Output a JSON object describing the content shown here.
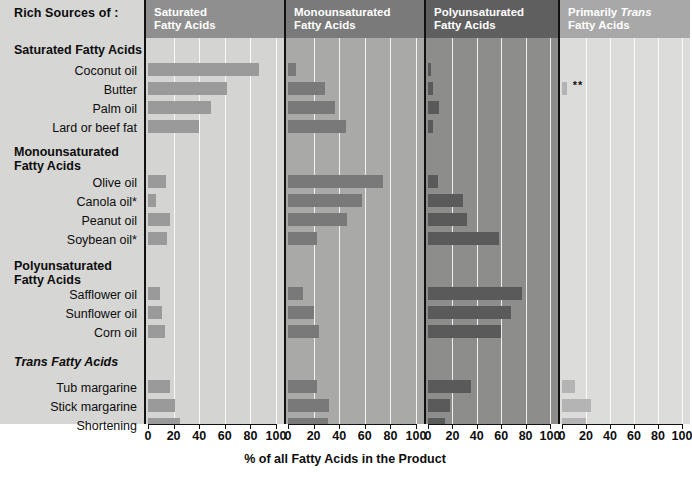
{
  "sidebar": {
    "title": "Rich Sources of :",
    "groups": [
      {
        "label": "Saturated Fatty Acids",
        "italic": false
      },
      {
        "label": "Monounsaturated\nFatty Acids",
        "italic": false
      },
      {
        "label": "Polyunsaturated\nFatty Acids",
        "italic": false
      },
      {
        "label": "Trans Fatty Acids",
        "italic": true
      }
    ],
    "row_labels": [
      "Coconut oil",
      "Butter",
      "Palm oil",
      "Lard or beef fat",
      "Olive oil",
      "Canola oil*",
      "Peanut oil",
      "Soybean oil*",
      "Safflower oil",
      "Sunflower oil",
      "Corn oil",
      "Tub margarine",
      "Stick margarine",
      "Shortening"
    ]
  },
  "panels": [
    {
      "title": "Saturated\nFatty Acids",
      "header_color": "#8f8f8f",
      "plot_color": "#d4d4d2",
      "bar_color": "#9a9a9a"
    },
    {
      "title": "Monounsaturated\nFatty Acids",
      "header_color": "#7a7a7a",
      "plot_color": "#a9a9a7",
      "bar_color": "#797979"
    },
    {
      "title": "Polyunsaturated\nFatty Acids",
      "header_color": "#5f5f5f",
      "plot_color": "#8d8d8b",
      "bar_color": "#5a5a5a"
    },
    {
      "title": "Primarily Trans\nFatty Acids",
      "header_color": "#a8a8a8",
      "plot_color": "#dcdcda",
      "bar_color": "#b4b4b4"
    }
  ],
  "annotations": {
    "butter_trans": "**"
  },
  "chart_data": {
    "type": "bar",
    "title": "Rich Sources of :",
    "xlabel": "% of all Fatty Acids in the Product",
    "ylabel": "",
    "xlim": [
      0,
      100
    ],
    "xticks": [
      0,
      20,
      40,
      60,
      80,
      100
    ],
    "grid": true,
    "legend_position": "panel-headers",
    "orientation": "horizontal",
    "categories": [
      "Coconut oil",
      "Butter",
      "Palm oil",
      "Lard or beef fat",
      "Olive oil",
      "Canola oil*",
      "Peanut oil",
      "Soybean oil*",
      "Safflower oil",
      "Sunflower oil",
      "Corn oil",
      "Tub margarine",
      "Stick margarine",
      "Shortening"
    ],
    "category_groups": [
      {
        "name": "Saturated Fatty Acids",
        "members": [
          "Coconut oil",
          "Butter",
          "Palm oil",
          "Lard or beef fat"
        ]
      },
      {
        "name": "Monounsaturated Fatty Acids",
        "members": [
          "Olive oil",
          "Canola oil*",
          "Peanut oil",
          "Soybean oil*"
        ]
      },
      {
        "name": "Polyunsaturated Fatty Acids",
        "members": [
          "Safflower oil",
          "Sunflower oil",
          "Corn oil"
        ]
      },
      {
        "name": "Trans Fatty Acids",
        "members": [
          "Tub margarine",
          "Stick margarine",
          "Shortening"
        ]
      }
    ],
    "series": [
      {
        "name": "Saturated Fatty Acids",
        "values": [
          87,
          62,
          49,
          40,
          14,
          6,
          17,
          15,
          9,
          11,
          13,
          17,
          21,
          25
        ]
      },
      {
        "name": "Monounsaturated Fatty Acids",
        "values": [
          6,
          29,
          37,
          45,
          74,
          58,
          46,
          23,
          12,
          20,
          24,
          23,
          32,
          31
        ]
      },
      {
        "name": "Polyunsaturated Fatty Acids",
        "values": [
          2,
          4,
          9,
          4,
          8,
          29,
          32,
          58,
          77,
          68,
          60,
          35,
          18,
          14
        ]
      },
      {
        "name": "Primarily Trans Fatty Acids",
        "values": [
          0,
          4,
          0,
          0,
          0,
          0,
          0,
          0,
          0,
          0,
          0,
          11,
          24,
          20
        ]
      }
    ],
    "footnotes": [
      "*",
      "**"
    ]
  }
}
